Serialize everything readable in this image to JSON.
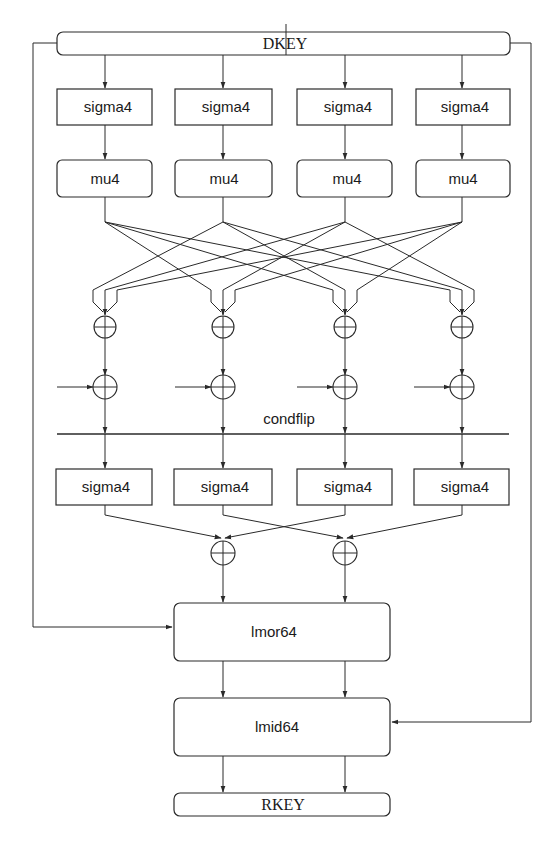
{
  "diagram": {
    "colors": {
      "stroke": "#2a2a2a",
      "text": "#1a1a1a",
      "background": "#ffffff"
    },
    "columns_x": [
      105,
      223,
      345,
      462
    ],
    "input": {
      "label": "DKEY",
      "x": 57,
      "y": 32,
      "w": 453,
      "h": 23
    },
    "row1_sigma": {
      "label": "sigma4",
      "y": 89,
      "h": 36
    },
    "row_mu": {
      "label": "mu4",
      "y": 160,
      "h": 37
    },
    "box_lefts": [
      57,
      175,
      297,
      416
    ],
    "box_width": 95,
    "xor_row1_y": 327,
    "xor_row2_y": 387,
    "condflip": {
      "label": "condflip",
      "line_y": 434,
      "label_x": 288,
      "label_y": 423
    },
    "row2_sigma": {
      "label": "sigma4",
      "y": 469,
      "h": 36
    },
    "xor_row3": {
      "xs": [
        223,
        345
      ],
      "y": 553
    },
    "lmor": {
      "label": "lmor64",
      "x": 174,
      "y": 603,
      "w": 216,
      "h": 58
    },
    "lmid": {
      "label": "lmid64",
      "x": 174,
      "y": 698,
      "w": 216,
      "h": 58
    },
    "output": {
      "label": "RKEY",
      "x": 174,
      "y": 793,
      "w": 216,
      "h": 23
    },
    "bypass": {
      "left_x": 33,
      "right_x": 531,
      "left_target_y": 627,
      "right_target_y": 722
    }
  },
  "labels": {
    "dkey": "DKEY",
    "sigma": [
      "sigma4",
      "sigma4",
      "sigma4",
      "sigma4"
    ],
    "mu": [
      "mu4",
      "mu4",
      "mu4",
      "mu4"
    ],
    "condflip": "condflip",
    "sigma2": [
      "sigma4",
      "sigma4",
      "sigma4",
      "sigma4"
    ],
    "lmor": "lmor64",
    "lmid": "lmid64",
    "rkey": "RKEY"
  },
  "icons": {
    "xor": "circled-plus-xor-icon",
    "arrow": "arrowhead-icon"
  }
}
